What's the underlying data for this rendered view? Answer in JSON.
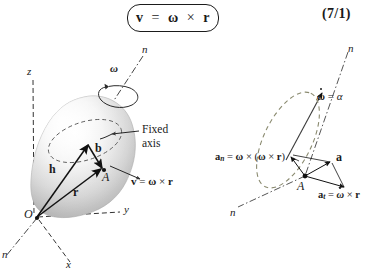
{
  "header": {
    "equation": "v = ω × r",
    "equation_parts": {
      "lhs": "v",
      "eq": "=",
      "omega": "ω",
      "times": "×",
      "r": "r"
    },
    "equation_number": "(7/1)"
  },
  "left_figure": {
    "name": "rigid-body-rotating-about-fixed-axis",
    "axis_labels": {
      "z": "z",
      "y": "y",
      "x": "x",
      "n_top": "n",
      "n_bottom": "n"
    },
    "omega_symbol": "ω",
    "fixed_axis_label_line1": "Fixed",
    "fixed_axis_label_line2": "axis",
    "origin_label": "O",
    "point_label": "A",
    "vectors": [
      {
        "name": "h",
        "label": "h"
      },
      {
        "name": "r",
        "label": "r"
      },
      {
        "name": "b",
        "label": "b"
      }
    ],
    "velocity_label": "v = ω × r"
  },
  "right_figure": {
    "name": "acceleration-components-of-point-A",
    "axis_labels": {
      "n_top": "n",
      "n_bottom": "n"
    },
    "alpha_label": "ω̇ = α",
    "point_label": "A",
    "normal_accel_label": "a_n = ω × (ω × r)",
    "total_accel_label": "a",
    "tangential_accel_label": "a_t = ω̇ × r"
  },
  "colors": {
    "ink": "#1a1a1a",
    "body_fill": "#c9c9c9",
    "body_highlight": "#f2f2f2",
    "dash": "#333333"
  }
}
